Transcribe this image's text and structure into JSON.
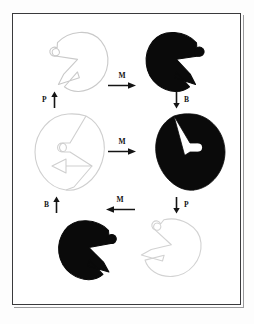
{
  "figure": {
    "background_color": "#ffffff",
    "frame_color": "#3a3a3c",
    "ink_color": "#000000",
    "outline_color": "#c8c8c8"
  },
  "labels": {
    "mirror": "M",
    "polarity": "P",
    "brightness": "B"
  },
  "transitions": [
    {
      "id": "top-m",
      "label": "M",
      "direction": "right",
      "row": "top"
    },
    {
      "id": "middle-m",
      "label": "M",
      "direction": "right",
      "row": "middle"
    },
    {
      "id": "bottom-m",
      "label": "M",
      "direction": "left",
      "row": "bottom"
    },
    {
      "id": "left-upper-p",
      "label": "P",
      "direction": "up",
      "side": "left"
    },
    {
      "id": "right-upper-b",
      "label": "B",
      "direction": "down",
      "side": "right"
    },
    {
      "id": "left-lower-b",
      "label": "B",
      "direction": "up",
      "side": "left"
    },
    {
      "id": "right-lower-p",
      "label": "P",
      "direction": "down",
      "side": "right"
    }
  ],
  "shapes": [
    {
      "id": "shape-top-left",
      "fill": "outline",
      "orientation": "opening-left-tilted",
      "row": 0,
      "col": 0
    },
    {
      "id": "shape-top-right",
      "fill": "solid",
      "orientation": "opening-right-tilted",
      "row": 0,
      "col": 1
    },
    {
      "id": "shape-middle-left",
      "fill": "outline",
      "orientation": "opening-right",
      "row": 1,
      "col": 0
    },
    {
      "id": "shape-middle-right",
      "fill": "solid",
      "orientation": "opening-left",
      "row": 1,
      "col": 1
    },
    {
      "id": "shape-bottom-left",
      "fill": "solid",
      "orientation": "opening-left-rotated",
      "row": 2,
      "col": 0
    },
    {
      "id": "shape-bottom-right",
      "fill": "outline",
      "orientation": "opening-right-rotated",
      "row": 2,
      "col": 1
    }
  ]
}
